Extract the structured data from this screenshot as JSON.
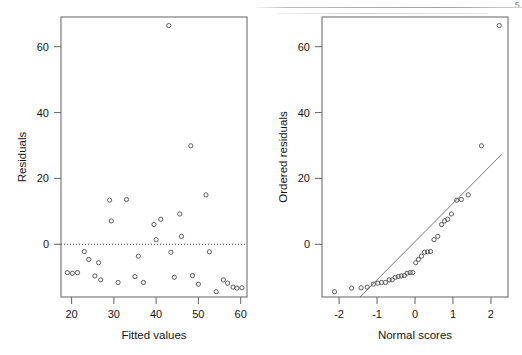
{
  "figure": {
    "page_folio": "5",
    "panel_count": 2
  },
  "chart_data": [
    {
      "type": "scatter",
      "panel": "left",
      "title": "",
      "xlabel": "Fitted values",
      "ylabel": "Residuals",
      "xlim": [
        17.5,
        61.5
      ],
      "ylim": [
        -16,
        69
      ],
      "xticks": [
        20,
        30,
        40,
        50,
        60
      ],
      "yticks": [
        0,
        20,
        40,
        60
      ],
      "grid": false,
      "reference_line": {
        "kind": "horizontal-dotted",
        "y": 0
      },
      "marker": "open-circle",
      "points": [
        {
          "x": 19.0,
          "y": -8.6
        },
        {
          "x": 20.2,
          "y": -8.8
        },
        {
          "x": 21.4,
          "y": -8.6
        },
        {
          "x": 23.0,
          "y": -2.2
        },
        {
          "x": 24.1,
          "y": -4.6
        },
        {
          "x": 25.5,
          "y": -9.6
        },
        {
          "x": 26.4,
          "y": -5.6
        },
        {
          "x": 26.9,
          "y": -10.8
        },
        {
          "x": 29.0,
          "y": 13.4
        },
        {
          "x": 29.4,
          "y": 7.1
        },
        {
          "x": 31.0,
          "y": -11.6
        },
        {
          "x": 33.0,
          "y": 13.6
        },
        {
          "x": 35.0,
          "y": -9.8
        },
        {
          "x": 35.8,
          "y": -3.6
        },
        {
          "x": 37.0,
          "y": -11.6
        },
        {
          "x": 39.5,
          "y": 6.0
        },
        {
          "x": 40.0,
          "y": 1.4
        },
        {
          "x": 41.1,
          "y": 7.6
        },
        {
          "x": 43.0,
          "y": 66.4
        },
        {
          "x": 43.5,
          "y": -2.4
        },
        {
          "x": 44.3,
          "y": -10.0
        },
        {
          "x": 45.6,
          "y": 9.2
        },
        {
          "x": 46.0,
          "y": 2.4
        },
        {
          "x": 48.2,
          "y": 29.9
        },
        {
          "x": 48.6,
          "y": -9.5
        },
        {
          "x": 50.0,
          "y": -12.1
        },
        {
          "x": 51.8,
          "y": 15.0
        },
        {
          "x": 52.6,
          "y": -2.3
        },
        {
          "x": 54.2,
          "y": -14.4
        },
        {
          "x": 55.9,
          "y": -10.8
        },
        {
          "x": 56.9,
          "y": -11.8
        },
        {
          "x": 58.2,
          "y": -13.0
        },
        {
          "x": 59.1,
          "y": -13.3
        },
        {
          "x": 60.3,
          "y": -13.2
        }
      ]
    },
    {
      "type": "scatter",
      "panel": "right",
      "title": "",
      "xlabel": "Normal scores",
      "ylabel": "Ordered residuals",
      "xlim": [
        -2.45,
        2.45
      ],
      "ylim": [
        -16,
        69
      ],
      "xticks": [
        -2,
        -1,
        0,
        1,
        2
      ],
      "yticks": [
        0,
        20,
        40,
        60
      ],
      "grid": false,
      "reference_line": {
        "kind": "qq-line",
        "x1": -1.45,
        "y1": -16.0,
        "x2": 2.3,
        "y2": 27.5
      },
      "marker": "open-circle",
      "points": [
        {
          "x": -2.12,
          "y": -14.4
        },
        {
          "x": -1.67,
          "y": -13.3
        },
        {
          "x": -1.42,
          "y": -13.2
        },
        {
          "x": -1.26,
          "y": -13.0
        },
        {
          "x": -1.1,
          "y": -12.1
        },
        {
          "x": -0.98,
          "y": -11.8
        },
        {
          "x": -0.88,
          "y": -11.6
        },
        {
          "x": -0.78,
          "y": -11.6
        },
        {
          "x": -0.68,
          "y": -10.8
        },
        {
          "x": -0.6,
          "y": -10.8
        },
        {
          "x": -0.52,
          "y": -10.0
        },
        {
          "x": -0.44,
          "y": -9.8
        },
        {
          "x": -0.36,
          "y": -9.6
        },
        {
          "x": -0.28,
          "y": -9.5
        },
        {
          "x": -0.21,
          "y": -8.8
        },
        {
          "x": -0.13,
          "y": -8.6
        },
        {
          "x": -0.06,
          "y": -8.6
        },
        {
          "x": 0.02,
          "y": -5.6
        },
        {
          "x": 0.09,
          "y": -4.6
        },
        {
          "x": 0.17,
          "y": -3.6
        },
        {
          "x": 0.25,
          "y": -2.4
        },
        {
          "x": 0.33,
          "y": -2.3
        },
        {
          "x": 0.41,
          "y": -2.2
        },
        {
          "x": 0.5,
          "y": 1.4
        },
        {
          "x": 0.6,
          "y": 2.4
        },
        {
          "x": 0.7,
          "y": 6.0
        },
        {
          "x": 0.78,
          "y": 7.1
        },
        {
          "x": 0.86,
          "y": 7.6
        },
        {
          "x": 0.96,
          "y": 9.2
        },
        {
          "x": 1.1,
          "y": 13.4
        },
        {
          "x": 1.22,
          "y": 13.6
        },
        {
          "x": 1.4,
          "y": 15.0
        },
        {
          "x": 1.75,
          "y": 29.9
        },
        {
          "x": 2.22,
          "y": 66.4
        }
      ]
    }
  ]
}
